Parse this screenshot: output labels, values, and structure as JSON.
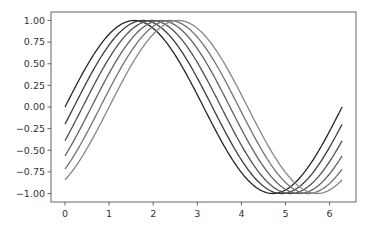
{
  "chart_data": {
    "type": "line",
    "title": "",
    "xlabel": "",
    "ylabel": "",
    "xlim": [
      -0.31,
      6.59
    ],
    "ylim": [
      -1.1,
      1.1
    ],
    "grid": false,
    "legend": null,
    "x_ticks": [
      0,
      1,
      2,
      3,
      4,
      5,
      6
    ],
    "x_tick_labels": [
      "0",
      "1",
      "2",
      "3",
      "4",
      "5",
      "6"
    ],
    "y_ticks": [
      1.0,
      0.75,
      0.5,
      0.25,
      0.0,
      -0.25,
      -0.5,
      -0.75,
      -1.0
    ],
    "y_tick_labels": [
      "1.00",
      "0.75",
      "0.50",
      "0.25",
      "0.00",
      "−0.25",
      "−0.50",
      "−0.75",
      "−1.00"
    ],
    "x_range": [
      0,
      6.283
    ],
    "series": [
      {
        "name": "sin(x)",
        "phase": 0.0,
        "color": "#262626",
        "start_value": 0.0,
        "end_value": 0.0
      },
      {
        "name": "sin(x-0.2)",
        "phase": 0.2,
        "color": "#3d3d3d",
        "start_value": -0.2,
        "end_value": -0.2
      },
      {
        "name": "sin(x-0.4)",
        "phase": 0.4,
        "color": "#4f4f4f",
        "start_value": -0.39,
        "end_value": -0.39
      },
      {
        "name": "sin(x-0.6)",
        "phase": 0.6,
        "color": "#626262",
        "start_value": -0.56,
        "end_value": -0.56
      },
      {
        "name": "sin(x-0.8)",
        "phase": 0.8,
        "color": "#747474",
        "start_value": -0.72,
        "end_value": -0.72
      },
      {
        "name": "sin(x-1.0)",
        "phase": 1.0,
        "color": "#878787",
        "start_value": -0.84,
        "end_value": -0.84
      }
    ]
  },
  "layout": {
    "plot_left": 51,
    "plot_top": 12,
    "plot_right": 356,
    "plot_bottom": 202,
    "x0_px": 65,
    "px_per_x": 44.1,
    "y0_px": 107,
    "px_per_y": 86.5
  }
}
